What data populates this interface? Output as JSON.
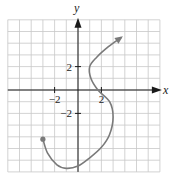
{
  "chart_data": {
    "type": "line",
    "title": "",
    "xlabel": "x",
    "ylabel": "y",
    "xlim": [
      -6,
      7
    ],
    "ylim": [
      -7,
      6
    ],
    "grid": true,
    "x_ticks": [
      {
        "value": -2,
        "label": "−2"
      },
      {
        "value": 2,
        "label": "2"
      }
    ],
    "y_ticks": [
      {
        "value": 2,
        "label": "2"
      },
      {
        "value": -2,
        "label": "−2"
      }
    ],
    "series": [
      {
        "name": "parametric curve",
        "start_marker": "filled-dot",
        "end_marker": "arrow",
        "points": [
          [
            -3,
            -4.2
          ],
          [
            -2.6,
            -5.4
          ],
          [
            -1.8,
            -6.4
          ],
          [
            -1,
            -6.7
          ],
          [
            0,
            -6.5
          ],
          [
            1,
            -5.8
          ],
          [
            2,
            -4.9
          ],
          [
            2.7,
            -3.8
          ],
          [
            3,
            -2.3
          ],
          [
            2.7,
            -1.0
          ],
          [
            1.7,
            0
          ],
          [
            1.1,
            1.0
          ],
          [
            1,
            2.0
          ],
          [
            1.6,
            2.8
          ],
          [
            2.6,
            3.7
          ],
          [
            3.7,
            4.5
          ]
        ]
      }
    ],
    "colors": {
      "curve": "#7a7a7a",
      "axes": "#1a1a1a",
      "grid": "#c8c8c8"
    }
  }
}
